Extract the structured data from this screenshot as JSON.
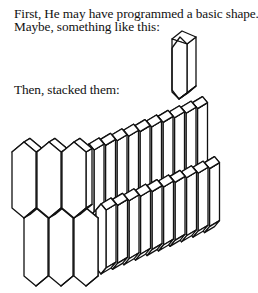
{
  "text": {
    "line1": "First, He may have programmed a basic shape.",
    "line2": "Maybe, something like this:",
    "line3": "Then, stacked them:"
  },
  "figures": {
    "basic_shape": {
      "icon": "hexagonal-prism-icon",
      "description": "single elongated hexagonal prism"
    },
    "stacked_shapes": {
      "icon": "stacked-prisms-icon",
      "description": "two staggered rows of hexagonal prisms stacked in depth"
    }
  },
  "colors": {
    "line": "#111111",
    "background": "#ffffff"
  }
}
